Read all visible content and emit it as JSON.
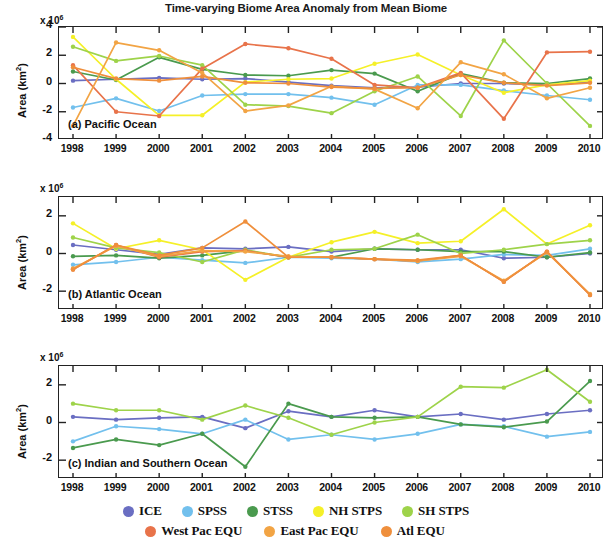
{
  "title": "Time-varying Biome Area Anomaly from Mean Biome",
  "axis": {
    "exponent_label": "x 10",
    "exponent_sup": "6",
    "ylabel_base": "Area (km",
    "ylabel_sup": "2",
    "ylabel_close": ")",
    "years": [
      "1998",
      "1999",
      "2000",
      "2001",
      "2002",
      "2003",
      "2004",
      "2005",
      "2006",
      "2007",
      "2008",
      "2009",
      "2010"
    ]
  },
  "panels": [
    {
      "id": "pacific",
      "label": "(a) Pacific Ocean",
      "yticks": [
        "4",
        "2",
        "0",
        "-2",
        "-4"
      ],
      "ytick_values": [
        4,
        2,
        0,
        -2,
        -4
      ],
      "ylim": [
        -4,
        4
      ]
    },
    {
      "id": "atlantic",
      "label": "(b) Atlantic Ocean",
      "yticks": [
        "2",
        "0",
        "-2"
      ],
      "ytick_values": [
        2,
        0,
        -2
      ],
      "ylim": [
        -3,
        3
      ]
    },
    {
      "id": "indian-southern",
      "label": "(c) Indian and Southern Ocean",
      "yticks": [
        "2",
        "0",
        "-2"
      ],
      "ytick_values": [
        2,
        0,
        -2
      ],
      "ylim": [
        -3,
        3
      ]
    }
  ],
  "legend": {
    "rows": [
      [
        {
          "label": "ICE",
          "color": "#6a6ec2"
        },
        {
          "label": "SPSS",
          "color": "#72c0ed"
        },
        {
          "label": "STSS",
          "color": "#4a9a4e"
        },
        {
          "label": "NH STPS",
          "color": "#f5f028"
        },
        {
          "label": "SH STPS",
          "color": "#9ed34a"
        }
      ],
      [
        {
          "label": "West Pac EQU",
          "color": "#e8734a"
        },
        {
          "label": "East Pac EQU",
          "color": "#f2a444"
        },
        {
          "label": "Atl EQU",
          "color": "#ef8f3c"
        }
      ]
    ]
  },
  "chart_data": {
    "type": "line",
    "title": "Time-varying Biome Area Anomaly from Mean Biome",
    "xlabel": "",
    "ylabel": "Area (km2)",
    "y_scale": "1e6",
    "x": [
      1998,
      1999,
      2000,
      2001,
      2002,
      2003,
      2004,
      2005,
      2006,
      2007,
      2008,
      2009,
      2010
    ],
    "grid": false,
    "legend_position": "bottom",
    "panels": [
      {
        "name": "(a) Pacific Ocean",
        "ylim": [
          -4,
          4
        ],
        "yticks": [
          4,
          2,
          0,
          -2,
          -4
        ],
        "series": [
          {
            "name": "ICE",
            "color": "#6a6ec2",
            "values": [
              0.2,
              0.3,
              0.4,
              0.3,
              0.35,
              0.1,
              -0.15,
              -0.3,
              -0.25,
              0.0,
              0.0,
              -0.1,
              0.1
            ]
          },
          {
            "name": "SPSS",
            "color": "#72c0ed",
            "values": [
              -1.7,
              -1.05,
              -1.95,
              -0.85,
              -0.75,
              -0.75,
              -1.0,
              -1.5,
              -0.1,
              -0.1,
              -0.5,
              -0.85,
              -1.15
            ]
          },
          {
            "name": "STSS",
            "color": "#4a9a4e",
            "values": [
              0.85,
              0.25,
              1.85,
              1.0,
              0.6,
              0.55,
              0.95,
              0.7,
              -0.55,
              0.7,
              0.05,
              0.0,
              0.35
            ]
          },
          {
            "name": "NH STPS",
            "color": "#f5f028",
            "values": [
              3.3,
              0.3,
              -2.25,
              -2.25,
              0.1,
              0.3,
              0.35,
              1.4,
              2.05,
              0.6,
              -0.65,
              -0.1,
              0.2
            ]
          },
          {
            "name": "SH STPS",
            "color": "#9ed34a",
            "values": [
              2.6,
              1.6,
              1.95,
              1.3,
              -1.5,
              -1.6,
              -2.1,
              -0.55,
              0.5,
              -2.3,
              3.05,
              0.0,
              -3.0
            ]
          },
          {
            "name": "West Pac EQU",
            "color": "#e8734a",
            "values": [
              1.3,
              -2.0,
              -2.3,
              1.05,
              2.8,
              2.5,
              1.75,
              -0.1,
              -0.3,
              0.75,
              -2.5,
              2.2,
              2.25
            ]
          },
          {
            "name": "East Pac EQU",
            "color": "#f2a444",
            "values": [
              -3.0,
              2.9,
              2.35,
              0.75,
              -1.95,
              -1.55,
              -0.2,
              -0.4,
              -1.75,
              1.5,
              0.65,
              -1.05,
              -0.3
            ]
          },
          {
            "name": "Atl EQU",
            "color": "#ef8f3c",
            "values": [
              1.15,
              0.35,
              0.2,
              0.5,
              0.05,
              0.0,
              -0.25,
              -0.35,
              -0.3,
              0.6,
              0.05,
              -0.15,
              0.05
            ]
          }
        ]
      },
      {
        "name": "(b) Atlantic Ocean",
        "ylim": [
          -3,
          3
        ],
        "yticks": [
          2,
          0,
          -2
        ],
        "series": [
          {
            "name": "ICE",
            "color": "#6a6ec2",
            "values": [
              0.45,
              0.2,
              -0.05,
              0.3,
              0.25,
              0.35,
              0.1,
              0.25,
              0.2,
              0.2,
              -0.25,
              -0.2,
              0.0
            ]
          },
          {
            "name": "SPSS",
            "color": "#72c0ed",
            "values": [
              -0.6,
              -0.45,
              -0.2,
              -0.35,
              -0.5,
              -0.2,
              -0.25,
              -0.3,
              -0.45,
              -0.3,
              -0.05,
              -0.1,
              0.25
            ]
          },
          {
            "name": "STSS",
            "color": "#4a9a4e",
            "values": [
              -0.15,
              -0.1,
              -0.25,
              -0.1,
              0.15,
              -0.2,
              -0.2,
              0.25,
              0.2,
              0.1,
              0.1,
              -0.2,
              0.05
            ]
          },
          {
            "name": "NH STPS",
            "color": "#f5f028",
            "values": [
              1.6,
              0.25,
              0.7,
              0.2,
              -1.4,
              -0.2,
              0.6,
              1.15,
              0.55,
              0.65,
              2.35,
              0.5,
              1.5
            ]
          },
          {
            "name": "SH STPS",
            "color": "#9ed34a",
            "values": [
              0.85,
              0.3,
              0.05,
              -0.45,
              0.2,
              -0.2,
              0.2,
              0.25,
              1.0,
              0.0,
              0.2,
              0.5,
              0.7
            ]
          },
          {
            "name": "West Pac EQU",
            "color": "#e8734a",
            "values": [
              -0.85,
              0.45,
              -0.2,
              0.1,
              0.15,
              -0.2,
              -0.2,
              -0.3,
              -0.4,
              -0.1,
              -1.5,
              0.1,
              -2.2
            ]
          },
          {
            "name": "East Pac EQU",
            "color": "#f2a444",
            "values": [
              -0.8,
              0.4,
              -0.15,
              0.15,
              0.1,
              -0.15,
              -0.2,
              -0.3,
              -0.4,
              -0.15,
              -1.45,
              0.05,
              -2.15
            ]
          },
          {
            "name": "Atl EQU",
            "color": "#ef8f3c",
            "values": [
              -0.85,
              0.45,
              -0.1,
              0.3,
              1.7,
              -0.2,
              -0.2,
              -0.3,
              -0.35,
              -0.1,
              -1.5,
              0.1,
              -2.2
            ]
          }
        ]
      },
      {
        "name": "(c) Indian and Southern Ocean",
        "ylim": [
          -3,
          3
        ],
        "yticks": [
          2,
          0,
          -2
        ],
        "series": [
          {
            "name": "ICE",
            "color": "#6a6ec2",
            "values": [
              0.3,
              0.15,
              0.25,
              0.3,
              -0.3,
              0.6,
              0.3,
              0.65,
              0.3,
              0.45,
              0.15,
              0.45,
              0.65
            ]
          },
          {
            "name": "SPSS",
            "color": "#72c0ed",
            "values": [
              -1.0,
              -0.2,
              -0.35,
              -0.6,
              0.15,
              -0.9,
              -0.65,
              -0.9,
              -0.6,
              -0.1,
              -0.2,
              -0.75,
              -0.5
            ]
          },
          {
            "name": "STSS",
            "color": "#4a9a4e",
            "values": [
              -1.35,
              -0.9,
              -1.2,
              -0.6,
              -2.35,
              1.0,
              0.3,
              0.25,
              0.3,
              -0.1,
              -0.25,
              0.05,
              2.2
            ]
          },
          {
            "name": "SH STPS",
            "color": "#9ed34a",
            "values": [
              1.0,
              0.65,
              0.65,
              0.15,
              0.9,
              0.25,
              -0.65,
              0.0,
              0.3,
              1.9,
              1.85,
              2.8,
              1.1
            ]
          }
        ]
      }
    ]
  }
}
